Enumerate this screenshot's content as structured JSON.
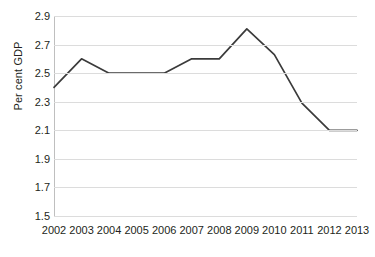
{
  "chart_data": {
    "type": "line",
    "title": "",
    "subtitle": "",
    "xlabel": "",
    "ylabel": "Per cent GDP",
    "categories": [
      "2002",
      "2003",
      "2004",
      "2005",
      "2006",
      "2007",
      "2008",
      "2009",
      "2010",
      "2011",
      "2012",
      "2013"
    ],
    "values": [
      2.4,
      2.6,
      2.5,
      2.5,
      2.5,
      2.6,
      2.6,
      2.81,
      2.63,
      2.29,
      2.1,
      2.1
    ],
    "series": [
      {
        "name": "Per cent GDP",
        "values": [
          2.4,
          2.6,
          2.5,
          2.5,
          2.5,
          2.6,
          2.6,
          2.81,
          2.63,
          2.29,
          2.1,
          2.1
        ]
      }
    ],
    "ylim": [
      1.5,
      2.9
    ],
    "yticks": [
      "1.5",
      "1.7",
      "1.9",
      "2.1",
      "2.3",
      "2.5",
      "2.7",
      "2.9"
    ],
    "ytick_values": [
      1.5,
      1.7,
      1.9,
      2.1,
      2.3,
      2.5,
      2.7,
      2.9
    ],
    "grid": true,
    "grid_axis": "y",
    "legend": false,
    "legend_position": "none",
    "markers": false,
    "line_color": "#3b3b3b",
    "grid_color": "#dcdcdc",
    "background_color": "#ffffff",
    "text_color": "#231f20"
  }
}
